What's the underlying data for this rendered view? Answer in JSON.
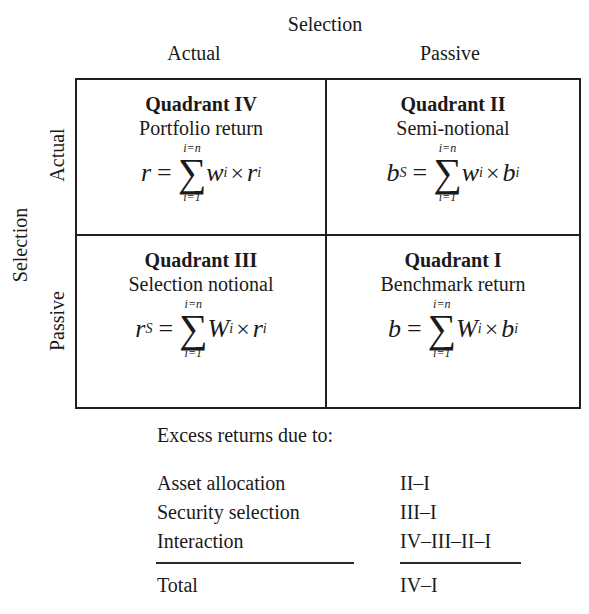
{
  "matrix": {
    "column_axis_title": "Selection",
    "column_headers": [
      "Actual",
      "Passive"
    ],
    "row_axis_title": "Selection",
    "row_headers": [
      "Actual",
      "Passive"
    ],
    "quadrants": {
      "top_left": {
        "title": "Quadrant IV",
        "subtitle": "Portfolio return",
        "lhs": "r",
        "lhs_sub": "",
        "weight": "w",
        "var": "r",
        "upper": "i=n",
        "lower": "i=1",
        "index": "i"
      },
      "top_right": {
        "title": "Quadrant II",
        "subtitle": "Semi-notional",
        "lhs": "b",
        "lhs_sub": "S",
        "weight": "w",
        "var": "b",
        "upper": "i=n",
        "lower": "i=1",
        "index": "i"
      },
      "bottom_left": {
        "title": "Quadrant III",
        "subtitle": "Selection notional",
        "lhs": "r",
        "lhs_sub": "S",
        "weight": "W",
        "var": "r",
        "upper": "i=n",
        "lower": "i=1",
        "index": "i"
      },
      "bottom_right": {
        "title": "Quadrant I",
        "subtitle": "Benchmark return",
        "lhs": "b",
        "lhs_sub": "",
        "weight": "W",
        "var": "b",
        "upper": "i=n",
        "lower": "i=1",
        "index": "i"
      }
    },
    "symbols": {
      "equals": "=",
      "sigma": "∑",
      "times": "×"
    }
  },
  "excess": {
    "title": "Excess returns due to:",
    "rows": [
      {
        "label": "Asset allocation",
        "value": "II–I"
      },
      {
        "label": "Security selection",
        "value": "III–I"
      },
      {
        "label": "Interaction",
        "value": "IV–III–II–I"
      }
    ],
    "total": {
      "label": "Total",
      "value": "IV–I"
    }
  }
}
